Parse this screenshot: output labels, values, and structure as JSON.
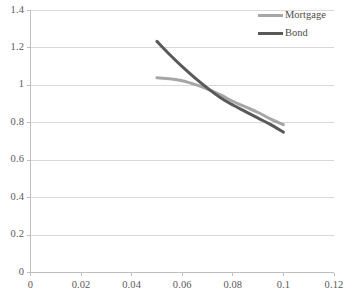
{
  "chart_data": {
    "type": "line",
    "title": "",
    "xlabel": "",
    "ylabel": "",
    "xlim": [
      0,
      0.12
    ],
    "ylim": [
      0,
      1.4
    ],
    "grid": true,
    "legend_position": "top-right",
    "x_ticks": [
      "0",
      "0.02",
      "0.04",
      "0.06",
      "0.08",
      "0.1",
      "0.12"
    ],
    "x_tick_values": [
      0,
      0.02,
      0.04,
      0.06,
      0.08,
      0.1,
      0.12
    ],
    "y_ticks": [
      "0",
      "0.2",
      "0.4",
      "0.6",
      "0.8",
      "1",
      "1.2",
      "1.4"
    ],
    "y_tick_values": [
      0,
      0.2,
      0.4,
      0.6,
      0.8,
      1,
      1.2,
      1.4
    ],
    "series": [
      {
        "name": "Mortgage",
        "color": "#a6a6a6",
        "x": [
          0.05,
          0.055,
          0.06,
          0.065,
          0.07,
          0.075,
          0.08,
          0.085,
          0.09,
          0.095,
          0.1
        ],
        "values": [
          1.04,
          1.035,
          1.025,
          1.005,
          0.98,
          0.95,
          0.915,
          0.885,
          0.855,
          0.82,
          0.79
        ]
      },
      {
        "name": "Bond",
        "color": "#595959",
        "x": [
          0.05,
          0.055,
          0.06,
          0.065,
          0.07,
          0.075,
          0.08,
          0.085,
          0.09,
          0.095,
          0.1
        ],
        "values": [
          1.235,
          1.165,
          1.1,
          1.04,
          0.985,
          0.935,
          0.895,
          0.86,
          0.825,
          0.79,
          0.75
        ]
      }
    ]
  },
  "legend": {
    "items": [
      {
        "label": "Mortgage",
        "color": "#a6a6a6"
      },
      {
        "label": "Bond",
        "color": "#595959"
      }
    ]
  },
  "axes": {
    "axis_color": "#bfbfbf",
    "grid_color": "#d9d9d9"
  }
}
